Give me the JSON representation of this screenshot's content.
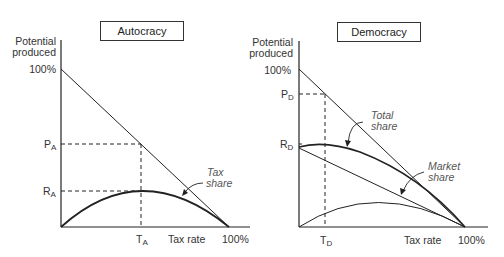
{
  "panels": [
    {
      "title": "Autocracy",
      "y_axis_label_line1": "Potential",
      "y_axis_label_line2": "produced",
      "y_top_tick": "100%",
      "y_mark_p": "P",
      "y_mark_p_sub": "A",
      "y_mark_r": "R",
      "y_mark_r_sub": "A",
      "x_mark": "T",
      "x_mark_sub": "A",
      "x_axis_label": "Tax rate",
      "x_end_tick": "100%",
      "annotation_line1": "Tax",
      "annotation_line2": "share"
    },
    {
      "title": "Democracy",
      "y_axis_label_line1": "Potential",
      "y_axis_label_line2": "produced",
      "y_top_tick": "100%",
      "y_mark_p": "P",
      "y_mark_p_sub": "D",
      "y_mark_r": "R",
      "y_mark_r_sub": "D",
      "x_mark": "T",
      "x_mark_sub": "D",
      "x_axis_label": "Tax rate",
      "x_end_tick": "100%",
      "annotation_total_line1": "Total",
      "annotation_total_line2": "share",
      "annotation_market_line1": "Market",
      "annotation_market_line2": "share"
    }
  ],
  "colors": {
    "line": "#222222",
    "text": "#333333",
    "annotation": "#555555"
  }
}
